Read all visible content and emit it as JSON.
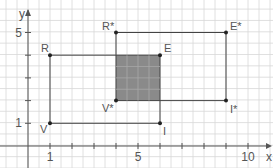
{
  "diagram": {
    "axes": {
      "x_label": "x",
      "y_label": "y",
      "x_ticks": [
        {
          "v": 1,
          "label": "1"
        },
        {
          "v": 5,
          "label": "5"
        },
        {
          "v": 10,
          "label": "10"
        }
      ],
      "y_ticks": [
        {
          "v": 1,
          "label": "1"
        },
        {
          "v": 5,
          "label": "5"
        }
      ]
    },
    "rectangle_original": {
      "points": [
        {
          "name": "V",
          "x": 1,
          "y": 1
        },
        {
          "name": "I",
          "x": 6,
          "y": 1
        },
        {
          "name": "E",
          "x": 6,
          "y": 4
        },
        {
          "name": "R",
          "x": 1,
          "y": 4
        }
      ]
    },
    "rectangle_image": {
      "points": [
        {
          "name": "V*",
          "x": 4,
          "y": 2
        },
        {
          "name": "I*",
          "x": 9,
          "y": 2
        },
        {
          "name": "E*",
          "x": 9,
          "y": 5
        },
        {
          "name": "R*",
          "x": 4,
          "y": 5
        }
      ]
    },
    "overlap": {
      "x1": 4,
      "y1": 2,
      "x2": 6,
      "y2": 4,
      "color": "#8a8a8a"
    },
    "colors": {
      "grid": "#d8d8d8",
      "axis": "#555555",
      "line": "#444444"
    }
  }
}
